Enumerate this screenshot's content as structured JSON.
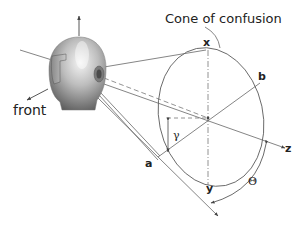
{
  "diagram": {
    "title": "Cone of confusion",
    "labels": {
      "front": "front",
      "x": "x",
      "b": "b",
      "a": "a",
      "y": "y",
      "z": "z",
      "gamma": "γ",
      "theta": "Θ"
    },
    "colors": {
      "line": "#555555",
      "text": "#222222",
      "head_light": "#e8e8e8",
      "head_dark": "#6a6a6a"
    }
  }
}
